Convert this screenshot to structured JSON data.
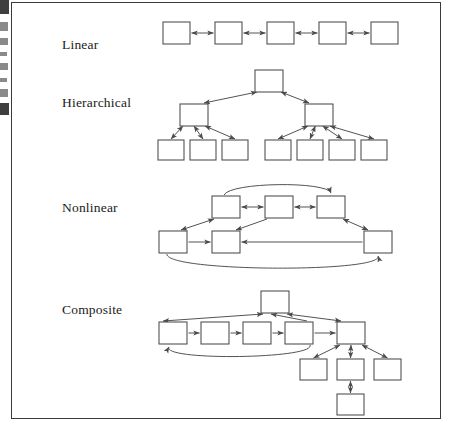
{
  "figure": {
    "caption_labels": [
      "Linear",
      "Hierarchical",
      "Nonlinear",
      "Composite"
    ],
    "border_color": "#3a3a3a",
    "box_stroke_color": "#4a4a4a",
    "arrow_color": "#4a4a4a",
    "background_color": "#ffffff"
  },
  "rows": [
    {
      "label": "Linear",
      "label_x": 62,
      "label_y": 37,
      "structure": "chain",
      "node_count": 5,
      "arrow_style": "bidirectional"
    },
    {
      "label": "Hierarchical",
      "label_x": 62,
      "label_y": 95,
      "structure": "tree",
      "node_count": 10,
      "arrow_style": "bidirectional",
      "levels": [
        1,
        2,
        7
      ],
      "left_child_leaves": 3,
      "right_child_leaves": 4
    },
    {
      "label": "Nonlinear",
      "label_x": 62,
      "label_y": 200,
      "structure": "network",
      "node_count": 6,
      "arrow_style": "mixed",
      "top_row_nodes": 3,
      "bottom_row_nodes": 3,
      "has_top_arc": true,
      "has_bottom_arc": true
    },
    {
      "label": "Composite",
      "label_x": 62,
      "label_y": 302,
      "structure": "composite",
      "node_count": 10,
      "arrow_style": "mixed",
      "chain_nodes": 5,
      "branch_leaves": 3,
      "has_feedback_arc": true
    }
  ],
  "linear": {
    "nodes": [
      {
        "x": 163,
        "y": 22,
        "w": 27,
        "h": 22
      },
      {
        "x": 215,
        "y": 22,
        "w": 27,
        "h": 22
      },
      {
        "x": 267,
        "y": 22,
        "w": 27,
        "h": 22
      },
      {
        "x": 319,
        "y": 22,
        "w": 27,
        "h": 22
      },
      {
        "x": 371,
        "y": 22,
        "w": 27,
        "h": 22
      }
    ]
  },
  "hierarchical": {
    "root": {
      "x": 255,
      "y": 70,
      "w": 28,
      "h": 22
    },
    "mid": [
      {
        "x": 180,
        "y": 104,
        "w": 28,
        "h": 22
      },
      {
        "x": 305,
        "y": 104,
        "w": 28,
        "h": 22
      }
    ],
    "leaves": [
      {
        "x": 158,
        "y": 140,
        "w": 26,
        "h": 20
      },
      {
        "x": 190,
        "y": 140,
        "w": 26,
        "h": 20
      },
      {
        "x": 222,
        "y": 140,
        "w": 26,
        "h": 20
      },
      {
        "x": 265,
        "y": 140,
        "w": 26,
        "h": 20
      },
      {
        "x": 297,
        "y": 140,
        "w": 26,
        "h": 20
      },
      {
        "x": 329,
        "y": 140,
        "w": 26,
        "h": 20
      },
      {
        "x": 361,
        "y": 140,
        "w": 26,
        "h": 20
      }
    ]
  },
  "nonlinear": {
    "top": [
      {
        "x": 212,
        "y": 196,
        "w": 28,
        "h": 22
      },
      {
        "x": 265,
        "y": 196,
        "w": 28,
        "h": 22
      },
      {
        "x": 317,
        "y": 196,
        "w": 28,
        "h": 22
      }
    ],
    "bottom": [
      {
        "x": 159,
        "y": 231,
        "w": 28,
        "h": 22
      },
      {
        "x": 212,
        "y": 231,
        "w": 28,
        "h": 22
      },
      {
        "x": 364,
        "y": 231,
        "w": 28,
        "h": 22
      }
    ]
  },
  "composite": {
    "top": {
      "x": 261,
      "y": 291,
      "w": 28,
      "h": 22
    },
    "chain": [
      {
        "x": 159,
        "y": 322,
        "w": 28,
        "h": 22
      },
      {
        "x": 201,
        "y": 322,
        "w": 28,
        "h": 22
      },
      {
        "x": 243,
        "y": 322,
        "w": 28,
        "h": 22
      },
      {
        "x": 285,
        "y": 322,
        "w": 28,
        "h": 22
      },
      {
        "x": 337,
        "y": 322,
        "w": 28,
        "h": 22
      }
    ],
    "leaves": [
      {
        "x": 300,
        "y": 359,
        "w": 27,
        "h": 21
      },
      {
        "x": 337,
        "y": 359,
        "w": 27,
        "h": 21
      },
      {
        "x": 374,
        "y": 359,
        "w": 27,
        "h": 21
      }
    ],
    "bottom": {
      "x": 337,
      "y": 394,
      "w": 27,
      "h": 21
    }
  },
  "scan_marks": [
    {
      "y": 0,
      "h": 14,
      "w": 9
    },
    {
      "y": 22,
      "h": 9,
      "w": 8
    },
    {
      "y": 38,
      "h": 7,
      "w": 8
    },
    {
      "y": 52,
      "h": 4,
      "w": 7
    },
    {
      "y": 63,
      "h": 7,
      "w": 8
    },
    {
      "y": 78,
      "h": 4,
      "w": 7
    },
    {
      "y": 89,
      "h": 8,
      "w": 8
    },
    {
      "y": 103,
      "h": 12,
      "w": 9
    }
  ]
}
